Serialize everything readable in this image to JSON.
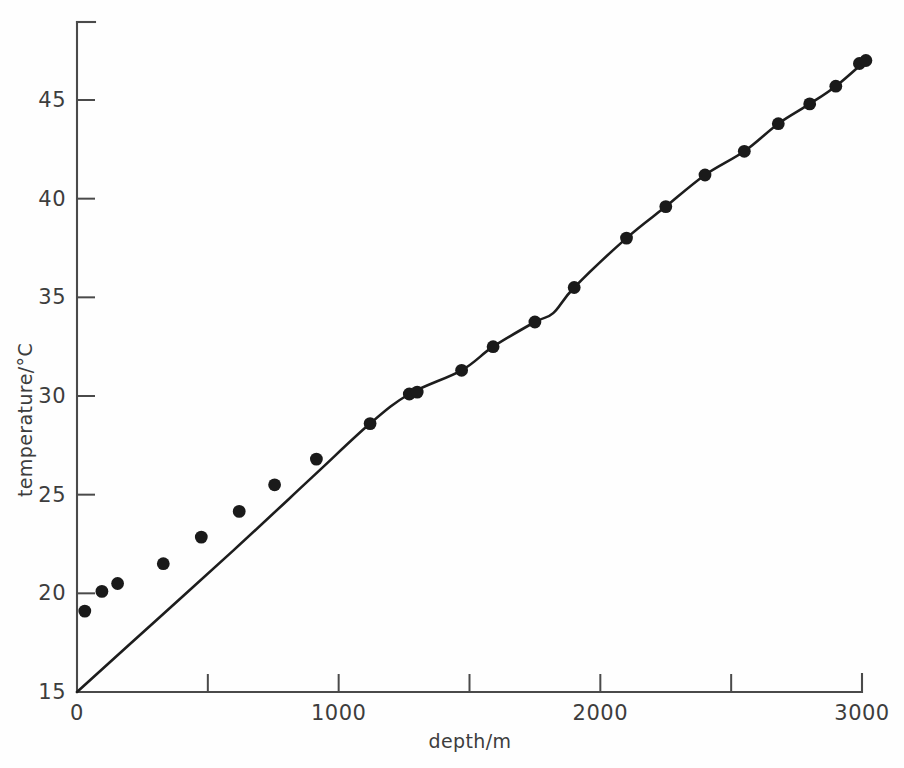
{
  "chart_data": {
    "type": "scatter",
    "title": "",
    "xlabel": "depth/m",
    "ylabel": "temperature/°C",
    "xlim": [
      0,
      3080
    ],
    "ylim": [
      15,
      48
    ],
    "grid": false,
    "legend": "none",
    "x_ticks": [
      0,
      1000,
      2000,
      3000
    ],
    "x_tick_labels": [
      "0",
      "1000",
      "2000",
      "3000"
    ],
    "x_minor_ticks": [
      500,
      1500,
      2500
    ],
    "y_ticks": [
      15,
      20,
      25,
      30,
      35,
      40,
      45
    ],
    "y_tick_labels": [
      "15",
      "20",
      "25",
      "30",
      "35",
      "40",
      "45"
    ],
    "series": [
      {
        "name": "measured temperature",
        "marker": "filled-circle",
        "color": "#1a1a1a",
        "x": [
          30,
          95,
          155,
          330,
          475,
          620,
          755,
          915,
          1120,
          1270,
          1300,
          1470,
          1590,
          1750,
          1900,
          2100,
          2250,
          2400,
          2550,
          2680,
          2800,
          2900,
          2990,
          3015
        ],
        "y": [
          19.1,
          20.1,
          20.5,
          21.5,
          22.85,
          24.15,
          25.5,
          26.8,
          28.6,
          30.1,
          30.2,
          31.3,
          32.5,
          33.75,
          35.5,
          38.0,
          39.6,
          41.2,
          42.4,
          43.8,
          44.8,
          45.7,
          46.85,
          47.0
        ]
      },
      {
        "name": "fitted gradient curve",
        "marker": "none",
        "color": "#1d1d1d",
        "x": [
          0,
          300,
          600,
          900,
          1120,
          1270,
          1470,
          1590,
          1750,
          1820,
          1900,
          2100,
          2250,
          2400,
          2550,
          2680,
          2800,
          2900,
          3005
        ],
        "y": [
          15.0,
          18.6,
          22.2,
          25.9,
          28.6,
          30.1,
          31.3,
          32.5,
          33.75,
          34.2,
          35.5,
          38.0,
          39.6,
          41.2,
          42.4,
          43.8,
          44.8,
          45.7,
          46.9
        ]
      }
    ]
  },
  "axes": {
    "x_title": "depth/m",
    "y_title": "temperature/°C"
  }
}
